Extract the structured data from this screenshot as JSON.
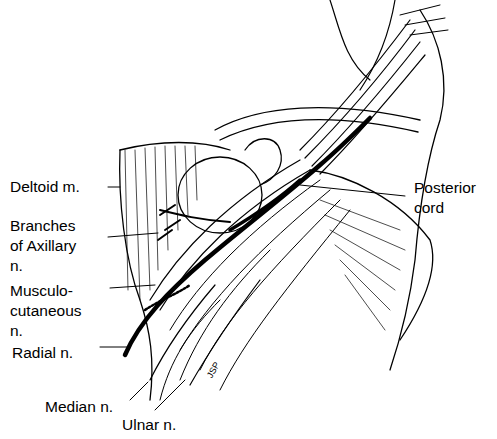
{
  "diagram": {
    "type": "anatomical line drawing",
    "labels": {
      "deltoid": "Deltoid m.",
      "axillary": "Branches\nof Axillary\nn.",
      "musculo": "Musculo-\ncutaneous\nn.",
      "radial": "Radial n.",
      "median": "Median n.",
      "ulnar": "Ulnar n.",
      "posterior": "Posterior\ncord"
    },
    "signature": "JSP"
  }
}
